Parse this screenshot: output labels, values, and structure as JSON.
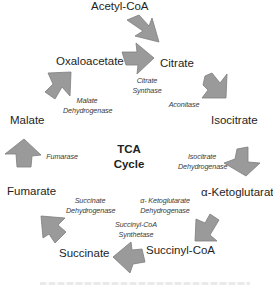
{
  "diagram": {
    "title_line1": "TCA",
    "title_line2": "Cycle",
    "arrow_color": "#9a9a9a",
    "metabolites": {
      "acetyl_coa": "Acetyl-CoA",
      "citrate": "Citrate",
      "isocitrate": "Isocitrate",
      "alpha_ketoglutarate": "α-Ketoglutarate",
      "succinyl_coa": "Succinyl-CoA",
      "succinate": "Succinate",
      "fumarate": "Fumarate",
      "malate": "Malate",
      "oxaloacetate": "Oxaloacetate"
    },
    "enzymes": {
      "citrate_synthase": [
        "Citrate",
        "Synthase"
      ],
      "aconitase": [
        "Aconitase"
      ],
      "isocitrate_dehydrogenase": [
        "Isocitrate",
        "Dehydrogenase"
      ],
      "akg_dehydrogenase": [
        "α- Ketoglutarate",
        "Dehydrogenase"
      ],
      "succinyl_coa_synthetase": [
        "Succinyl-CoA",
        "Synthetase"
      ],
      "succinate_dehydrogenase": [
        "Succinate",
        "Dehydrogenase"
      ],
      "fumarase": [
        "Fumarase"
      ],
      "malate_dehydrogenase": [
        "Malate",
        "Dehydrogenase"
      ]
    }
  }
}
